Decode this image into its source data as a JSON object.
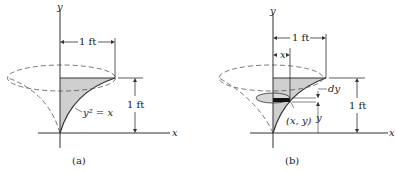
{
  "figure_a": {
    "caption": "(a)",
    "axis_x": "x",
    "axis_y": "y",
    "width_label": "1 ft",
    "height_label": "1 ft",
    "curve_label": "y² = x"
  },
  "figure_b": {
    "caption": "(b)",
    "axis_x": "x",
    "axis_y": "y",
    "width_label": "1 ft",
    "height_label": "1 ft",
    "x_dim_label": "x",
    "dy_label": "dy",
    "y_dim_label": "y",
    "point_label": "(x, y)"
  },
  "colors": {
    "shade": "#cfcfcf",
    "line": "#333333",
    "element": "#111111"
  }
}
